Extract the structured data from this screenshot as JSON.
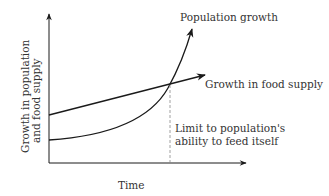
{
  "diagram": {
    "axes": {
      "x_label": "Time",
      "y_label_line1": "Growth in population",
      "y_label_line2": "and food supply"
    },
    "curves": {
      "population": "Population growth",
      "food": "Growth in food supply"
    },
    "annotation": {
      "line1": "Limit to population's",
      "line2": "ability to feed itself"
    },
    "colors": {
      "stroke": "#1a1a1a",
      "text": "#333333",
      "dashed": "#888888"
    }
  }
}
